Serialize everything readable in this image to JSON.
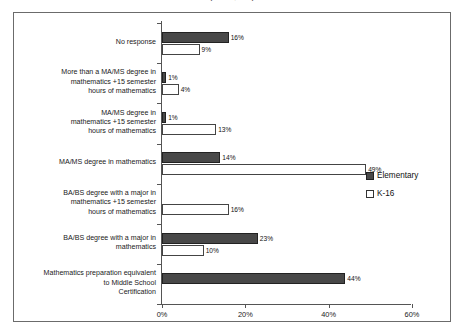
{
  "title_remnant": "(N = 2,012)",
  "legend": {
    "position": "right-middle",
    "items": [
      {
        "label": "Elementary",
        "color": "#484848",
        "swatch": "filled-square-icon"
      },
      {
        "label": "K-16",
        "color": "#ffffff",
        "swatch": "empty-square-icon"
      }
    ]
  },
  "axis": {
    "x_ticks": [
      "0%",
      "20%",
      "40%",
      "60%"
    ],
    "x_tick_values": [
      0,
      20,
      40,
      60
    ],
    "x_min": 0,
    "x_max": 60
  },
  "chart_data": {
    "type": "bar",
    "orientation": "horizontal",
    "title": "(N = 2,012)",
    "xlabel": "",
    "ylabel": "",
    "xlim": [
      0,
      60
    ],
    "grid": false,
    "legend_position": "right",
    "categories": [
      "No response",
      "More than a MA/MS degree in mathematics +15 semester hours of mathematics",
      "MA/MS degree in mathematics +15 semester hours of mathematics",
      "MA/MS degree in mathematics",
      "BA/BS degree with a major in mathematics +15 semester hours of mathematics",
      "BA/BS degree with a major in mathematics",
      "Mathematics preparation equivalent to Middle School Certification"
    ],
    "series": [
      {
        "name": "Elementary",
        "values": [
          16,
          1,
          1,
          14,
          0,
          23,
          44
        ]
      },
      {
        "name": "K-16",
        "values": [
          9,
          4,
          13,
          49,
          16,
          10,
          0
        ]
      }
    ]
  },
  "rows": [
    {
      "label_lines": [
        "No response"
      ],
      "elementary": {
        "value": 16,
        "label": "16%"
      },
      "k16": {
        "value": 9,
        "label": "9%"
      }
    },
    {
      "label_lines": [
        "More than a MA/MS degree in",
        "mathematics +15 semester",
        "hours of mathematics"
      ],
      "elementary": {
        "value": 1,
        "label": "1%"
      },
      "k16": {
        "value": 4,
        "label": "4%"
      }
    },
    {
      "label_lines": [
        "MA/MS degree in",
        "mathematics +15 semester",
        "hours of mathematics"
      ],
      "elementary": {
        "value": 1,
        "label": "1%"
      },
      "k16": {
        "value": 13,
        "label": "13%"
      }
    },
    {
      "label_lines": [
        "MA/MS degree in mathematics"
      ],
      "elementary": {
        "value": 14,
        "label": "14%"
      },
      "k16": {
        "value": 49,
        "label": "49%"
      }
    },
    {
      "label_lines": [
        "BA/BS degree with a major in",
        "mathematics +15 semester",
        "hours of mathematics"
      ],
      "elementary": {
        "value": 0,
        "label": ""
      },
      "k16": {
        "value": 16,
        "label": "16%"
      }
    },
    {
      "label_lines": [
        "BA/BS degree with a major in",
        "mathematics"
      ],
      "elementary": {
        "value": 23,
        "label": "23%"
      },
      "k16": {
        "value": 10,
        "label": "10%"
      }
    },
    {
      "label_lines": [
        "Mathematics preparation equivalent",
        "to Middle School",
        "Certification"
      ],
      "elementary": {
        "value": 44,
        "label": "44%"
      },
      "k16": {
        "value": 0,
        "label": ""
      }
    }
  ]
}
